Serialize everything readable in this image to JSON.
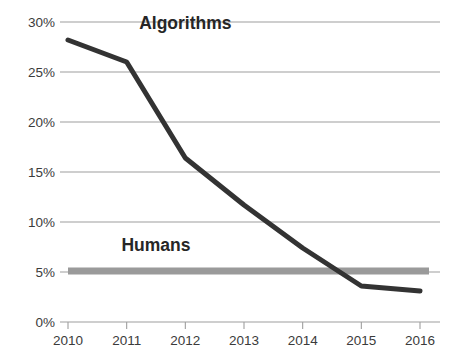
{
  "chart_data": {
    "type": "line",
    "title": "",
    "subtitle": "",
    "xlabel": "",
    "ylabel": "",
    "x": [
      2010,
      2011,
      2012,
      2013,
      2014,
      2015,
      2016
    ],
    "categories": [
      "2010",
      "2011",
      "2012",
      "2013",
      "2014",
      "2015",
      "2016"
    ],
    "xtick_labels": [
      "2010",
      "2011",
      "2012",
      "2013",
      "2014",
      "2015",
      "2016"
    ],
    "ytick_labels": [
      "0%",
      "5%",
      "10%",
      "15%",
      "20%",
      "25%",
      "30%"
    ],
    "ytick_values": [
      0,
      5,
      10,
      15,
      20,
      25,
      30
    ],
    "ylim": [
      0,
      30
    ],
    "xlim": [
      2010,
      2016
    ],
    "grid": "horizontal",
    "legend_position": "inline-annotation",
    "series": [
      {
        "name": "Algorithms",
        "values": [
          28.2,
          26.0,
          16.4,
          11.7,
          7.4,
          3.6,
          3.1
        ],
        "color": "#333333",
        "style": "line",
        "width": 5,
        "annotation": "Algorithms",
        "annotation_x": 2012.0,
        "annotation_y": 29.3
      },
      {
        "name": "Humans",
        "values": [
          5.1,
          5.1,
          5.1,
          5.1,
          5.1,
          5.1,
          5.1
        ],
        "color": "#9a9a9a",
        "style": "band",
        "width": 7,
        "annotation": "Humans",
        "annotation_x": 2011.5,
        "annotation_y": 7.1
      }
    ],
    "colors": {
      "algorithms": "#333333",
      "humans": "#9a9a9a",
      "gridline": "#9e9e9e",
      "tick": "#9e9e9e",
      "text": "#3b3b3b",
      "annotation_text": "#262626",
      "background": "#ffffff"
    }
  },
  "axes": {
    "y_ticks": [
      {
        "label": "30%",
        "value": 30
      },
      {
        "label": "25%",
        "value": 25
      },
      {
        "label": "20%",
        "value": 20
      },
      {
        "label": "15%",
        "value": 15
      },
      {
        "label": "10%",
        "value": 10
      },
      {
        "label": "5%",
        "value": 5
      },
      {
        "label": "0%",
        "value": 0
      }
    ],
    "x_ticks": [
      {
        "label": "2010",
        "value": 2010
      },
      {
        "label": "2011",
        "value": 2011
      },
      {
        "label": "2012",
        "value": 2012
      },
      {
        "label": "2013",
        "value": 2013
      },
      {
        "label": "2014",
        "value": 2014
      },
      {
        "label": "2015",
        "value": 2015
      },
      {
        "label": "2016",
        "value": 2016
      }
    ]
  },
  "annotations": {
    "algorithms_label": "Algorithms",
    "humans_label": "Humans"
  }
}
